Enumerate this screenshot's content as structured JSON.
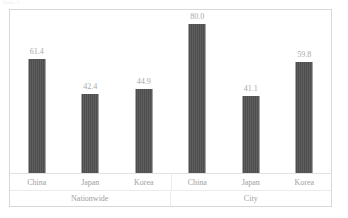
{
  "caption": {
    "text": "Table 1"
  },
  "chart_data": {
    "type": "bar",
    "title": "",
    "xlabel": "",
    "ylabel": "",
    "ylim": [
      0,
      88
    ],
    "grid": false,
    "legend": "none",
    "categories": [
      "China",
      "Japan",
      "Korea",
      "China",
      "Japan",
      "Korea"
    ],
    "groups": [
      {
        "label": "Nationwide",
        "span": 3
      },
      {
        "label": "City",
        "span": 3
      }
    ],
    "values": [
      61.4,
      42.4,
      44.9,
      80.0,
      41.1,
      59.8
    ],
    "value_labels": [
      "61.4",
      "42.4",
      "44.9",
      "80.0",
      "41.1",
      "59.8"
    ],
    "bars": [
      {
        "group": "Nationwide",
        "category": "China",
        "value": 61.4,
        "label": "61.4"
      },
      {
        "group": "Nationwide",
        "category": "Japan",
        "value": 42.4,
        "label": "42.4"
      },
      {
        "group": "Nationwide",
        "category": "Korea",
        "value": 44.9,
        "label": "44.9"
      },
      {
        "group": "City",
        "category": "China",
        "value": 80.0,
        "label": "80.0"
      },
      {
        "group": "City",
        "category": "Japan",
        "value": 41.1,
        "label": "41.1"
      },
      {
        "group": "City",
        "category": "Korea",
        "value": 59.8,
        "label": "59.8"
      }
    ],
    "colors": {
      "bar": "#4d4d4d",
      "frame": "#d8d8d8",
      "gridline": "#ececec",
      "text": "#a0a0a0"
    }
  }
}
